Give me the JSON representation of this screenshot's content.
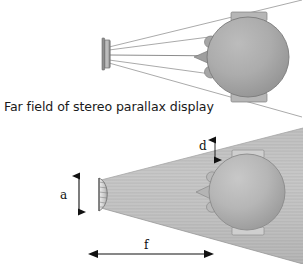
{
  "figure": {
    "title": "Far field of stereo parallax display",
    "background_color": "#ffffff",
    "width": 303,
    "height": 264
  },
  "caption": {
    "text": "Far field of stereo parallax display",
    "x": 4,
    "y": 111
  },
  "panels": {
    "top": {
      "name": "near-field-ray-panel",
      "description": "Flat stereo parallax display emitting diverging rays toward a viewer head seen from above",
      "display": {
        "label": "flat-display-panel",
        "x": 104,
        "y": 40,
        "width": 6,
        "height": 28,
        "color": "#9a9a9a"
      },
      "head": {
        "label": "viewer-head-top-view",
        "cx": 248,
        "cy": 57,
        "rx": 41,
        "ry": 40,
        "fill": "#a8a8a8",
        "stroke": "#7b7b7b"
      },
      "ray_count": 5
    },
    "bottom": {
      "name": "far-field-cone-panel",
      "description": "Curved display aperture emitting a textured gray far-field cone toward a viewer head",
      "display": {
        "label": "curved-display-aperture",
        "x": 96,
        "y": 178,
        "width": 9,
        "height": 33,
        "color": "#d0d0d0"
      },
      "cone": {
        "label": "far-field-beam-cone",
        "fill_light": "#c9c9c9",
        "fill_dark": "#9d9d9d",
        "apex_x": 101,
        "apex_y": 194
      },
      "head": {
        "label": "viewer-head-top-view",
        "cx": 247,
        "cy": 192,
        "rx": 38,
        "ry": 38,
        "fill": "#b2b2b2",
        "stroke": "#8a8a8a"
      }
    }
  },
  "annotations": {
    "aperture": {
      "symbol": "a",
      "meaning": "display aperture height",
      "label_x": 62,
      "label_y": 199,
      "arrow_x": 79,
      "arrow_y_top": 175,
      "arrow_y_bottom": 213
    },
    "spot": {
      "symbol": "d",
      "meaning": "far-field spot size",
      "label_x": 201,
      "label_y": 148,
      "arrow_x": 215,
      "arrow_y_top": 140,
      "arrow_y_bottom": 160
    },
    "focal": {
      "symbol": "f",
      "meaning": "far-field distance",
      "label_x": 146,
      "label_y": 248,
      "arrow_y": 254,
      "arrow_x_left": 97,
      "arrow_x_right": 205
    }
  }
}
